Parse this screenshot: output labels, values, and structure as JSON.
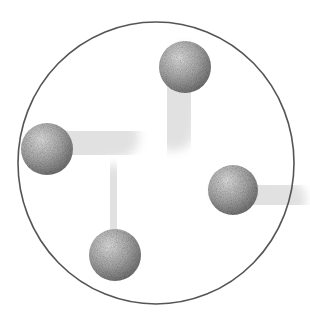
{
  "diagram": {
    "colors": {
      "background": "#ffffff",
      "container_stroke": "#555555",
      "sphere_light": "#e2e2e2",
      "sphere_dark": "#7a7a7a",
      "trail": "#d8d8d8"
    },
    "container": {
      "cx": 156,
      "cy": 163,
      "rx": 138,
      "ry": 141
    },
    "spheres": [
      {
        "name": "top",
        "cx": 185,
        "cy": 67,
        "r": 26,
        "trail": {
          "dx": -12,
          "dy": 62,
          "width": 44
        }
      },
      {
        "name": "left",
        "cx": 47,
        "cy": 149,
        "r": 26,
        "trail": {
          "dx": 70,
          "dy": -12,
          "width": 44
        }
      },
      {
        "name": "right",
        "cx": 233,
        "cy": 190,
        "r": 25,
        "trail": {
          "dx": 52,
          "dy": 10,
          "width": 42
        }
      },
      {
        "name": "bottom",
        "cx": 115,
        "cy": 255,
        "r": 26,
        "trail": {
          "dx": -3,
          "dy": -68,
          "width": 44
        }
      }
    ]
  }
}
